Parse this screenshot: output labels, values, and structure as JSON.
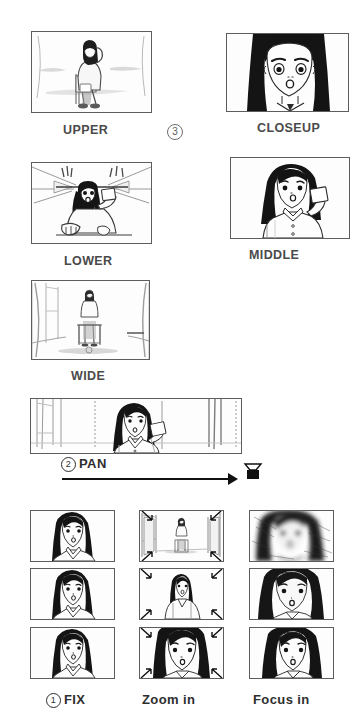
{
  "document": {
    "type": "storyboard-sheet",
    "ink_color": "#3a3a3a",
    "frame_color": "#5d5d5d",
    "background": "#ffffff"
  },
  "shot_rows": {
    "row1": {
      "left": {
        "label": "UPPER",
        "shot_name": "upper-angle-shot",
        "description": "Girl seated on bench seen from a high angle, holding phone to ear"
      },
      "marker": "3",
      "right": {
        "label": "CLOSEUP",
        "shot_name": "closeup-shot",
        "description": "Tight close-up of girl's face, long black hair, surprised expression"
      }
    },
    "row2": {
      "left": {
        "label": "LOWER",
        "shot_name": "lower-angle-shot",
        "description": "Low angle looking up at girl holding a card, ceiling lines converging"
      },
      "right": {
        "label": "MIDDLE",
        "shot_name": "middle-shot",
        "description": "Medium waist-up shot of girl holding a card in her raised hand"
      }
    },
    "row3": {
      "left": {
        "label": "WIDE",
        "shot_name": "wide-shot",
        "description": "Wide shot of girl seated alone on a bench in a large room"
      }
    }
  },
  "pan_section": {
    "marker": "2",
    "label": "PAN",
    "shot_name": "pan-shot",
    "description": "Wide horizontal panorama panel with girl at centre; camera pans left to right",
    "arrow_direction": "left-to-right",
    "camera_icon": "camera-icon"
  },
  "technique_grid": {
    "columns": [
      {
        "marker": "1",
        "label": "FIX",
        "name": "fix",
        "frames": [
          {
            "description": "Girl's face, fixed framing, frame 1"
          },
          {
            "description": "Girl's face, fixed framing, frame 2"
          },
          {
            "description": "Girl's face, fixed framing, frame 3"
          }
        ]
      },
      {
        "marker": "",
        "label": "Zoom in",
        "name": "zoom-in",
        "frames": [
          {
            "description": "Wide view of girl seated in room, arrows pointing inward"
          },
          {
            "description": "Medium view of girl, arrows pointing inward"
          },
          {
            "description": "Close-up of girl's face, arrows pointing inward"
          }
        ]
      },
      {
        "marker": "",
        "label": "Focus in",
        "name": "focus-in",
        "frames": [
          {
            "description": "Heavily blurred / out-of-focus face"
          },
          {
            "description": "Partially focused face"
          },
          {
            "description": "Fully sharp focused face"
          }
        ]
      }
    ]
  }
}
